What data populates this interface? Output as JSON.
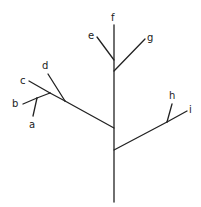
{
  "diagram": {
    "type": "phylogenetic-tree",
    "labels": {
      "a": "a",
      "b": "b",
      "c": "c",
      "d": "d",
      "e": "e",
      "f": "f",
      "g": "g",
      "h": "h",
      "i": "i"
    },
    "colors": {
      "line": "#222222",
      "background": "#ffffff"
    }
  }
}
